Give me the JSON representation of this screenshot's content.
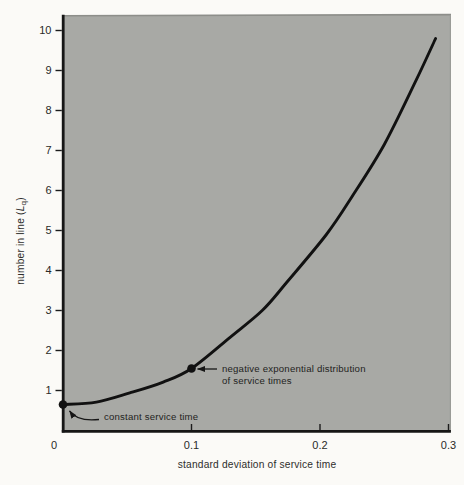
{
  "figure": {
    "bg_color": "#fbfaf7",
    "plot_bg_color": "#a8a9a5",
    "ink_color": "#161616",
    "text_color": "#2a2a28"
  },
  "chart_data": {
    "type": "line",
    "title": "",
    "xlabel": "standard deviation of service time",
    "ylabel": "number in line (Lq)",
    "ylabel_parts": {
      "prefix": "number in line (",
      "variable": "L",
      "subscript": "q",
      "suffix": ")"
    },
    "xlim": [
      0,
      0.3
    ],
    "ylim": [
      0,
      10
    ],
    "grid": false,
    "legend": false,
    "x_ticks": [
      {
        "value": 0,
        "label": "0"
      },
      {
        "value": 0.1,
        "label": "0.1"
      },
      {
        "value": 0.2,
        "label": "0.2"
      },
      {
        "value": 0.3,
        "label": "0.3"
      }
    ],
    "y_ticks": [
      {
        "value": 1,
        "label": "1"
      },
      {
        "value": 2,
        "label": "2"
      },
      {
        "value": 3,
        "label": "3"
      },
      {
        "value": 4,
        "label": "4"
      },
      {
        "value": 5,
        "label": "5"
      },
      {
        "value": 6,
        "label": "6"
      },
      {
        "value": 7,
        "label": "7"
      },
      {
        "value": 8,
        "label": "8"
      },
      {
        "value": 9,
        "label": "9"
      },
      {
        "value": 10,
        "label": "10"
      }
    ],
    "series": [
      {
        "name": "number in line vs standard deviation of service time",
        "x": [
          0,
          0.026,
          0.052,
          0.078,
          0.1,
          0.13,
          0.155,
          0.174,
          0.205,
          0.225,
          0.25,
          0.275,
          0.29
        ],
        "y": [
          0.65,
          0.71,
          0.94,
          1.21,
          1.55,
          2.33,
          3.0,
          3.7,
          4.9,
          5.85,
          7.15,
          8.77,
          9.8
        ]
      }
    ],
    "annotations": [
      {
        "x": 0,
        "y": 0.65,
        "lines": [
          "constant service time"
        ]
      },
      {
        "x": 0.1,
        "y": 1.55,
        "lines": [
          "negative exponential distribution",
          "of service times"
        ]
      }
    ]
  }
}
